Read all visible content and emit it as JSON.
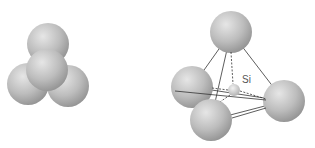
{
  "figures": [
    {
      "id": "space-filling-model",
      "spheres": [
        {
          "name": "top",
          "cx": 48,
          "cy": 44,
          "r": 21
        },
        {
          "name": "left",
          "cx": 28,
          "cy": 84,
          "r": 21
        },
        {
          "name": "right",
          "cx": 68,
          "cy": 86,
          "r": 21
        },
        {
          "name": "front",
          "cx": 47,
          "cy": 70,
          "r": 21
        }
      ]
    },
    {
      "id": "tetrahedron-model",
      "label": "Si",
      "spheres": [
        {
          "name": "top",
          "cx": 231,
          "cy": 32,
          "r": 21
        },
        {
          "name": "left",
          "cx": 192,
          "cy": 87,
          "r": 21
        },
        {
          "name": "right",
          "cx": 284,
          "cy": 101,
          "r": 21
        },
        {
          "name": "bottom",
          "cx": 211,
          "cy": 120,
          "r": 21
        }
      ],
      "center": {
        "cx": 234,
        "cy": 90,
        "r": 6
      }
    }
  ],
  "colors": {
    "sphere_light": "#e2e2e2",
    "sphere_mid": "#b4b4b4",
    "sphere_dark": "#8a8a8a",
    "edge": "#333333"
  }
}
